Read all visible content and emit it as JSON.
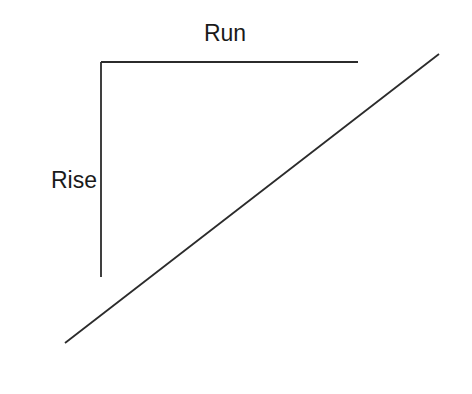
{
  "diagram": {
    "labels": {
      "run": "Run",
      "rise": "Rise"
    },
    "colors": {
      "line": "#2b2b2b",
      "text": "#1a1a1a",
      "background": "#ffffff"
    }
  }
}
